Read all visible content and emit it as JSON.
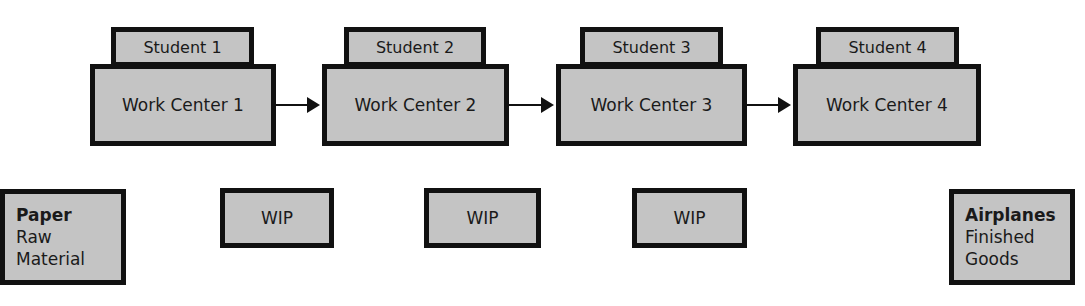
{
  "work_centers": [
    {
      "student": "Student 1",
      "label": "Work Center 1"
    },
    {
      "student": "Student 2",
      "label": "Work Center 2"
    },
    {
      "student": "Student 3",
      "label": "Work Center 3"
    },
    {
      "student": "Student 4",
      "label": "Work Center 4"
    }
  ],
  "inventory": {
    "raw": {
      "title": "Paper",
      "line1": "Raw",
      "line2": "Material"
    },
    "wip": [
      "WIP",
      "WIP",
      "WIP"
    ],
    "finished": {
      "title": "Airplanes",
      "line1": "Finished",
      "line2": "Goods"
    }
  },
  "colors": {
    "box_fill": "#c4c4c4",
    "border": "#111111"
  }
}
